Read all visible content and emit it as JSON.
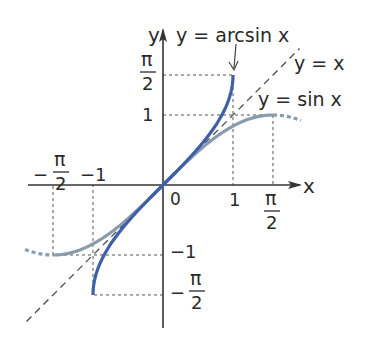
{
  "diagram": {
    "type": "function-graph",
    "origin_px": [
      163,
      185
    ],
    "unit_px": 70,
    "colors": {
      "arcsin": "#3d5fa8",
      "sin": "#8a9bad",
      "axis": "#333333",
      "guide": "#555555",
      "identity": "#4a4a4a"
    },
    "axes": {
      "x_label": "x",
      "y_label": "y",
      "origin_label": "0"
    },
    "ticks": {
      "x": [
        {
          "value": 1,
          "label": "1"
        },
        {
          "value": 1.5708,
          "label_num": "π",
          "label_den": "2"
        },
        {
          "value": -1,
          "label": "−1"
        },
        {
          "value": -1.5708,
          "label_sign": "−",
          "label_num": "π",
          "label_den": "2"
        }
      ],
      "y": [
        {
          "value": 1,
          "label": "1"
        },
        {
          "value": 1.5708,
          "label_num": "π",
          "label_den": "2"
        },
        {
          "value": -1,
          "label": "−1"
        },
        {
          "value": -1.5708,
          "label_sign": "−",
          "label_num": "π",
          "label_den": "2"
        }
      ]
    },
    "curves": [
      {
        "name": "arcsin",
        "label": "y = arcsin x",
        "domain": [
          -1,
          1
        ],
        "range": [
          -1.5708,
          1.5708
        ],
        "style": "solid"
      },
      {
        "name": "sin",
        "label": "y = sin x",
        "domain": [
          -1.5708,
          1.5708
        ],
        "range": [
          -1,
          1
        ],
        "style": "solid",
        "extension": "dashed beyond ±π/2"
      },
      {
        "name": "identity",
        "label": "y = x",
        "style": "dashed"
      }
    ],
    "labels": {
      "arcsin": "y = arcsin x",
      "sin": "y = sin x",
      "identity": "y = x",
      "x_pos_1": "1",
      "x_neg_1": "−1",
      "y_pos_1": "1",
      "y_neg_1": "−1",
      "pi": "π",
      "two": "2",
      "minus": "−"
    }
  }
}
